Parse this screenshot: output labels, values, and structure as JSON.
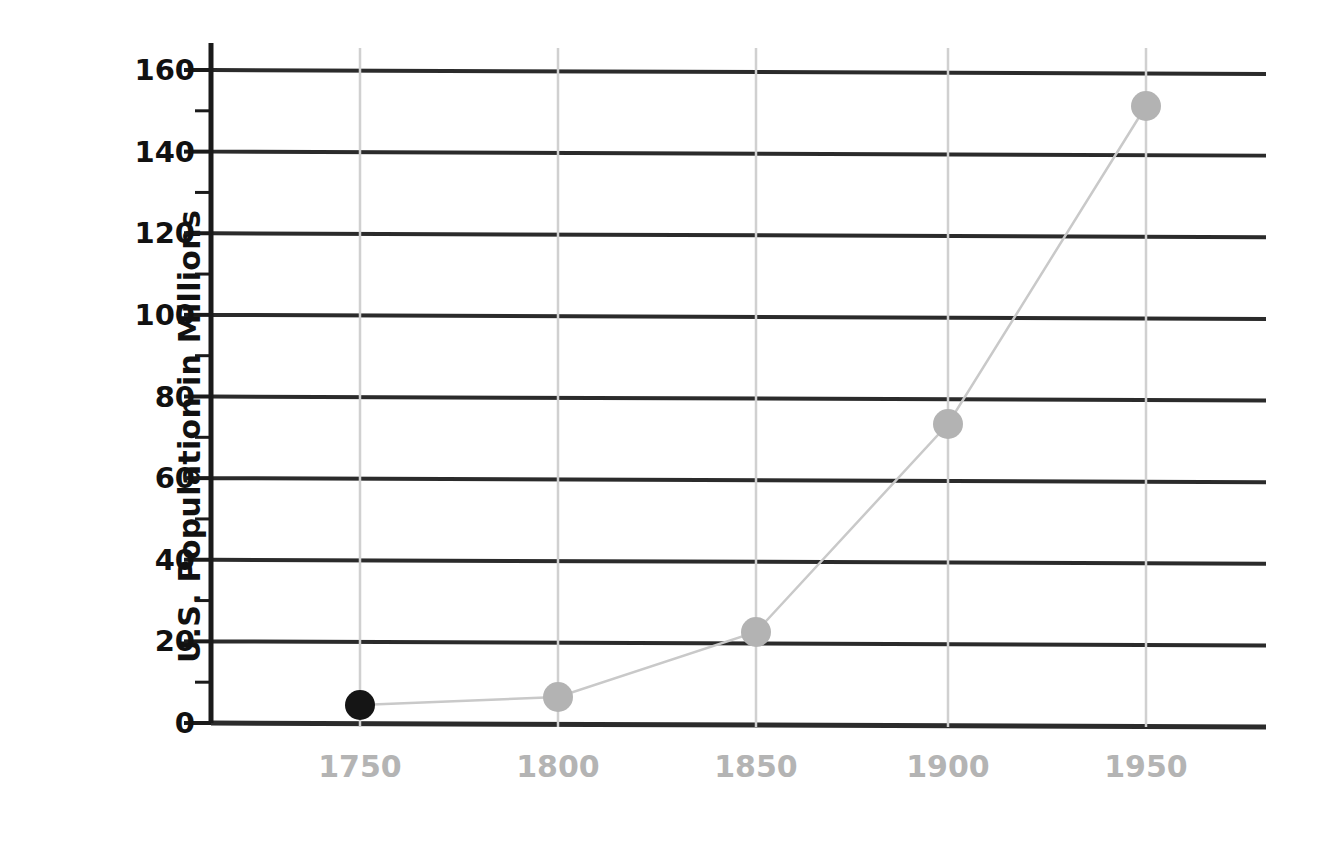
{
  "chart_data": {
    "type": "line",
    "title": "",
    "xlabel": "",
    "ylabel": "U.S. Population in Millions",
    "x": [
      1750,
      1800,
      1850,
      1900,
      1950
    ],
    "categories": [
      "1750",
      "1800",
      "1850",
      "1900",
      "1950"
    ],
    "values": [
      4,
      6,
      22,
      74,
      152
    ],
    "series": [
      {
        "name": "U.S. Population",
        "values": [
          4,
          6,
          22,
          74,
          152
        ]
      }
    ],
    "xlim": [
      1725,
      1975
    ],
    "ylim": [
      0,
      160
    ],
    "y_ticks": [
      0,
      20,
      40,
      60,
      80,
      100,
      120,
      140,
      160
    ],
    "y_tick_labels": [
      "0",
      "20",
      "40",
      "60",
      "80",
      "100",
      "120",
      "140",
      "160"
    ],
    "y_minor_ticks": [
      10,
      30,
      50,
      70,
      90,
      110,
      130,
      150
    ],
    "x_ticks": [
      1750,
      1800,
      1850,
      1900,
      1950
    ],
    "x_tick_labels": [
      "1750",
      "1800",
      "1850",
      "1900",
      "1950"
    ],
    "grid": {
      "horizontal": true,
      "vertical": true
    },
    "legend": {
      "visible": false,
      "position": "none"
    },
    "highlighted_point": {
      "x": 1750,
      "y": 4,
      "label": "1750"
    },
    "annotations": []
  },
  "style": {
    "background": "#ffffff",
    "axis_color": "#1a1a1a",
    "hgrid_color": "#2b2b2b",
    "vgrid_color": "#d0d0d0",
    "line_color": "#c9c9c9",
    "marker_color": "#b3b3b3",
    "marker_highlight_color": "#151515",
    "y_label_color": "#111111",
    "x_label_color": "#b4b4b4"
  },
  "points": [
    {
      "label": "1750",
      "value": 4,
      "highlight": true,
      "cx": 360,
      "cy": 705
    },
    {
      "label": "1800",
      "value": 6,
      "highlight": false,
      "cx": 558,
      "cy": 697
    },
    {
      "label": "1850",
      "value": 22,
      "highlight": false,
      "cx": 756,
      "cy": 632
    },
    {
      "label": "1900",
      "value": 74,
      "highlight": false,
      "cx": 948,
      "cy": 424
    },
    {
      "label": "1950",
      "value": 152,
      "highlight": false,
      "cx": 1146,
      "cy": 106
    }
  ]
}
